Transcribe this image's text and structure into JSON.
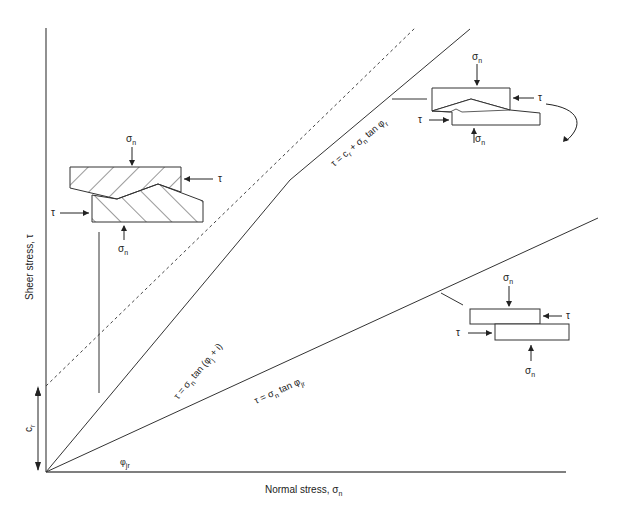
{
  "axes": {
    "y_label": "Sheer stress, τ",
    "x_label_main": "Normal stress, σ",
    "x_label_sub": "n",
    "cr_label_main": "c",
    "cr_label_sub": "r",
    "angle_label_main": "φ",
    "angle_label_sub": "jr"
  },
  "lines": {
    "steep_label": {
      "pre": "τ = σ",
      "sub1": "n",
      "mid": " tan (φ",
      "sub2": "j",
      "post": " + i)"
    },
    "upper_label": {
      "pre": "τ = c",
      "sub1": "r",
      "mid": " + σ",
      "sub2": "n",
      "mid2": " tan φ",
      "sub3": "r"
    },
    "lower_label": {
      "pre": "τ = σ",
      "sub1": "n",
      "mid": " tan φ",
      "sub2": "jr"
    }
  },
  "insets": {
    "left": {
      "top_force": "σ",
      "top_force_sub": "n",
      "right_force": "τ",
      "left_force": "τ",
      "bottom_force": "σ",
      "bottom_force_sub": "n"
    },
    "top_right": {
      "top_force": "σ",
      "top_force_sub": "n",
      "right_force": "τ",
      "left_force": "τ",
      "bottom_force": "σ",
      "bottom_force_sub": "n"
    },
    "bottom_right": {
      "top_force": "σ",
      "top_force_sub": "n",
      "right_force": "τ",
      "left_force": "τ",
      "bottom_force": "σ",
      "bottom_force_sub": "n"
    }
  },
  "colors": {
    "line": "#333333",
    "background": "#ffffff"
  }
}
